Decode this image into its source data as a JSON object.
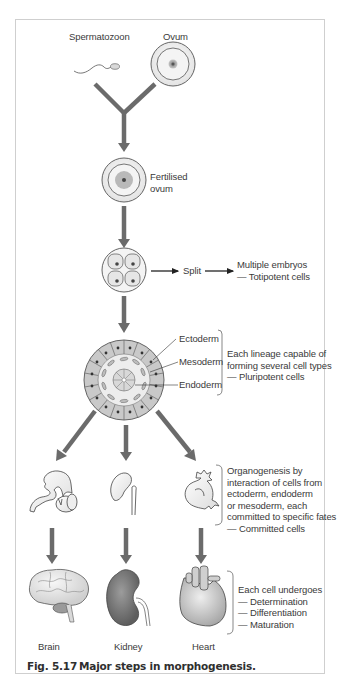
{
  "figure": {
    "number": "Fig. 5.17",
    "title": "Major steps in morphogenesis."
  },
  "stages": {
    "gametes": {
      "sperm_label": "Spermatozoon",
      "ovum_label": "Ovum"
    },
    "zygote": {
      "label": "Fertilised\novum"
    },
    "cleavage": {
      "split_label": "Split",
      "outcome": "Multiple embryos\n— Totipotent cells"
    },
    "germ_layers": {
      "layers": [
        "Ectoderm",
        "Mesoderm",
        "Endoderm"
      ],
      "note": "Each lineage capable of\nforming several cell types\n— Pluripotent cells"
    },
    "organogenesis": {
      "note": "Organogenesis by\ninteraction of cells from\nectoderm, endoderm\nor mesoderm, each\ncommitted to specific fates\n— Committed cells"
    },
    "organs": {
      "items": [
        "Brain",
        "Kidney",
        "Heart"
      ],
      "note": "Each cell undergoes\n— Determination\n— Differentiation\n— Maturation"
    }
  },
  "colors": {
    "arrow": "#6b6b6b",
    "cell_fill": "#c9c9c9",
    "kidney": "#8a8a8a",
    "frame": "#cfcfcf"
  }
}
